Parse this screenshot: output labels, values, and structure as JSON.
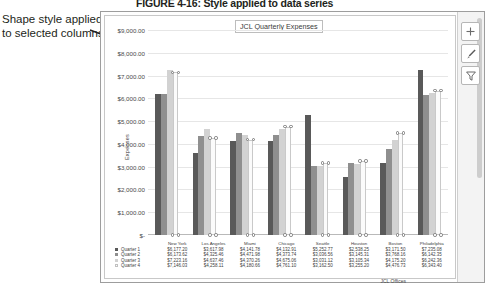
{
  "figure": {
    "caption_number": "FIGURE 4-16:",
    "caption_text": "Style applied to data series"
  },
  "annotation": {
    "line1": "Shape style applied",
    "line2": "to selected columns",
    "pointer_icon": "arrow-pointer"
  },
  "window": {
    "chart_buttons": [
      {
        "name": "chart-elements",
        "icon": "plus-icon",
        "label": "+"
      },
      {
        "name": "chart-styles",
        "icon": "paintbrush-icon",
        "label": ""
      },
      {
        "name": "chart-filters",
        "icon": "funnel-icon",
        "label": ""
      }
    ],
    "scrollbar": "vertical-scrollbar"
  },
  "chart_data": {
    "type": "bar",
    "title": "JCL Quarterly Expenses",
    "xlabel": "JCL Offices",
    "ylabel": "Expenses",
    "grid": true,
    "legend": "data-table",
    "ylim": [
      0,
      9000
    ],
    "ytick_labels": [
      "$9,000.00",
      "$8,000.00",
      "$7,000.00",
      "$6,000.00",
      "$5,000.00",
      "$4,000.00",
      "$3,000.00",
      "$2,000.00",
      "$1,000.00",
      "$-"
    ],
    "ytick_values": [
      9000,
      8000,
      7000,
      6000,
      5000,
      4000,
      3000,
      2000,
      1000,
      0
    ],
    "categories": [
      "New York",
      "Los Angeles",
      "Miami",
      "Chicago",
      "Seattle",
      "Houston",
      "Boston",
      "Philadelphia"
    ],
    "series": [
      {
        "name": "Quarter 1",
        "color": "#595959",
        "values": [
          6177.2,
          3617.98,
          4141.78,
          4132.91,
          5252.77,
          2538.25,
          3171.5,
          7235.08
        ],
        "labels": [
          "$6,177.20",
          "$3,617.98",
          "$4,141.78",
          "$4,132.91",
          "$5,252.77",
          "$2,538.25",
          "$3,171.50",
          "$7,235.08"
        ]
      },
      {
        "name": "Quarter 2",
        "color": "#8f8f8f",
        "values": [
          6173.62,
          4325.46,
          4471.98,
          4373.74,
          3036.56,
          3145.31,
          3768.16,
          6142.35
        ],
        "labels": [
          "$6,173.62",
          "$4,325.46",
          "$4,471.98",
          "$4,373.74",
          "$3,036.56",
          "$3,145.31",
          "$3,768.16",
          "$6,142.35"
        ]
      },
      {
        "name": "Quarter 3",
        "color": "#d2d2d2",
        "values": [
          7223.16,
          4637.46,
          4370.26,
          4675.06,
          3031.12,
          3105.34,
          4175.2,
          6242.36
        ],
        "labels": [
          "$7,223.16",
          "$4,637.46",
          "$4,370.26",
          "$4,675.06",
          "$3,031.12",
          "$3,105.34",
          "$4,175.20",
          "$6,242.36"
        ]
      },
      {
        "name": "Quarter 4",
        "color": "#fbfbfb",
        "values": [
          7146.03,
          4258.11,
          4180.66,
          4761.1,
          3162.5,
          3255.2,
          4476.73,
          6343.4
        ],
        "labels": [
          "$7,146.03",
          "$4,258.11",
          "$4,180.66",
          "$4,761.10",
          "$3,162.50",
          "$3,255.20",
          "$4,476.73",
          "$6,343.40"
        ],
        "selected": true
      }
    ]
  }
}
